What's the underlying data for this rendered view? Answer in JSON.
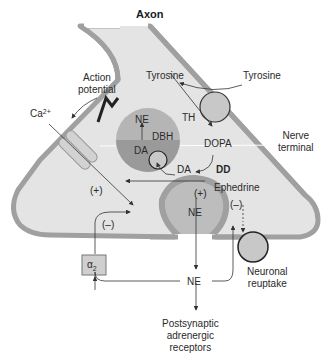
{
  "title": "Axon",
  "labels": {
    "action_potential": "Action\npotential",
    "calcium": "Ca",
    "calcium_charge": "2+",
    "tyrosine_inside": "Tyrosine",
    "tyrosine_outside": "Tyrosine",
    "th": "TH",
    "dopa": "DOPA",
    "dd": "DD",
    "da_cytoplasm": "DA",
    "vesicle_ne": "NE",
    "vesicle_dbh": "DBH",
    "vesicle_da": "DA",
    "nerve_terminal": "Nerve\nterminal",
    "plus_left": "(+)",
    "plus_right": "(+)",
    "minus_alpha": "(–)",
    "minus_ephedrine": "(–)",
    "ephedrine": "Ephedrine",
    "release_ne": "NE",
    "alpha2": "α",
    "alpha2_sub": "2",
    "synapse_ne": "NE",
    "neuronal_reuptake": "Neuronal\nreuptake",
    "postsynaptic": "Postsynaptic\nadrenergic\nreceptors"
  },
  "colors": {
    "membrane": "#a0a0a0",
    "cytoplasm": "#e4e4e4",
    "vesicle_outer": "#b5b5b5",
    "vesicle_inner": "#9a9a9a",
    "transporter": "#c8c8c8",
    "text": "#2a2a2a",
    "arrow": "#333333"
  }
}
